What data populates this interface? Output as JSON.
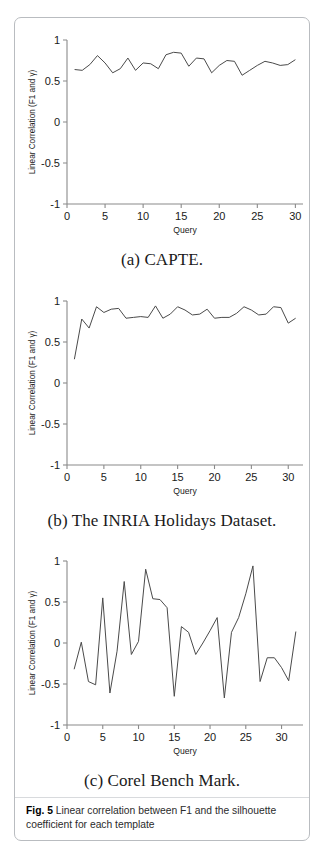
{
  "figure": {
    "label": "Fig. 5",
    "caption": "Linear correlation between F1 and the silhouette coefficient for each template"
  },
  "panels": [
    {
      "id": "panel-a",
      "subcaption": "(a) CAPTE."
    },
    {
      "id": "panel-b",
      "subcaption": "(b) The INRIA Holidays Dataset."
    },
    {
      "id": "panel-c",
      "subcaption": "(c) Corel Bench Mark."
    }
  ],
  "chart_data": [
    {
      "type": "line",
      "panel": "a",
      "title": "(a) CAPTE.",
      "xlabel": "Query",
      "ylabel": "Linear Correlation (F1 and γ)",
      "xlim": [
        0,
        31
      ],
      "ylim": [
        -1,
        1
      ],
      "xticks": [
        0,
        5,
        10,
        15,
        20,
        25,
        30
      ],
      "xtick_labels": [
        "0",
        "5",
        "10",
        "15",
        "20",
        "25",
        "30"
      ],
      "yticks": [
        -1,
        -0.5,
        0,
        0.5,
        1
      ],
      "ytick_labels": [
        "-1",
        "-0.5",
        "0",
        "0.5",
        "1"
      ],
      "grid": false,
      "legend": null,
      "line_color": "#4a4a4a",
      "x": [
        1,
        2,
        3,
        4,
        5,
        6,
        7,
        8,
        9,
        10,
        11,
        12,
        13,
        14,
        15,
        16,
        17,
        18,
        19,
        20,
        21,
        22,
        23,
        24,
        25,
        26,
        27,
        28,
        29,
        30
      ],
      "values": [
        0.64,
        0.63,
        0.7,
        0.81,
        0.72,
        0.6,
        0.65,
        0.78,
        0.63,
        0.72,
        0.71,
        0.65,
        0.82,
        0.85,
        0.84,
        0.68,
        0.78,
        0.77,
        0.6,
        0.69,
        0.75,
        0.74,
        0.57,
        0.63,
        0.69,
        0.74,
        0.72,
        0.69,
        0.7,
        0.76
      ]
    },
    {
      "type": "line",
      "panel": "b",
      "title": "(b) The INRIA Holidays Dataset.",
      "xlabel": "Query",
      "ylabel": "Linear Correlation (F1 and γ)",
      "xlim": [
        0,
        32
      ],
      "ylim": [
        -1,
        1
      ],
      "xticks": [
        0,
        5,
        10,
        15,
        20,
        25,
        30
      ],
      "xtick_labels": [
        "0",
        "5",
        "10",
        "15",
        "20",
        "25",
        "30"
      ],
      "yticks": [
        -1,
        -0.5,
        0,
        0.5,
        1
      ],
      "ytick_labels": [
        "-1",
        "-0.5",
        "0",
        "0.5",
        "1"
      ],
      "grid": false,
      "legend": null,
      "line_color": "#4a4a4a",
      "x": [
        1,
        2,
        3,
        4,
        5,
        6,
        7,
        8,
        9,
        10,
        11,
        12,
        13,
        14,
        15,
        16,
        17,
        18,
        19,
        20,
        21,
        22,
        23,
        24,
        25,
        26,
        27,
        28,
        29,
        30,
        31
      ],
      "values": [
        0.29,
        0.78,
        0.67,
        0.93,
        0.86,
        0.9,
        0.91,
        0.79,
        0.8,
        0.81,
        0.8,
        0.94,
        0.79,
        0.84,
        0.93,
        0.89,
        0.83,
        0.84,
        0.9,
        0.79,
        0.8,
        0.8,
        0.85,
        0.93,
        0.89,
        0.83,
        0.84,
        0.93,
        0.92,
        0.73,
        0.79
      ]
    },
    {
      "type": "line",
      "panel": "c",
      "title": "(c) Corel Bench Mark.",
      "xlabel": "Query",
      "ylabel": "Linear Correlation (F1 and γ)",
      "xlim": [
        0,
        33
      ],
      "ylim": [
        -1,
        1
      ],
      "xticks": [
        0,
        5,
        10,
        15,
        20,
        25,
        30
      ],
      "xtick_labels": [
        "0",
        "5",
        "10",
        "15",
        "20",
        "25",
        "30"
      ],
      "yticks": [
        -1,
        -0.5,
        0,
        0.5,
        1
      ],
      "ytick_labels": [
        "-1",
        "-0.5",
        "0",
        "0.5",
        "1"
      ],
      "grid": false,
      "legend": null,
      "line_color": "#4a4a4a",
      "x": [
        1,
        2,
        3,
        4,
        5,
        6,
        7,
        8,
        9,
        10,
        11,
        12,
        13,
        14,
        15,
        16,
        17,
        18,
        19,
        20,
        21,
        22,
        23,
        24,
        25,
        26,
        27,
        28,
        29,
        30,
        31,
        32
      ],
      "values": [
        -0.32,
        0.01,
        -0.47,
        -0.51,
        0.55,
        -0.61,
        -0.1,
        0.75,
        -0.14,
        0.02,
        0.9,
        0.54,
        0.53,
        0.43,
        -0.65,
        0.2,
        0.13,
        -0.14,
        0.0,
        0.15,
        0.31,
        -0.67,
        0.13,
        0.31,
        0.6,
        0.94,
        -0.47,
        -0.18,
        -0.18,
        -0.3,
        -0.46,
        0.14
      ]
    }
  ]
}
